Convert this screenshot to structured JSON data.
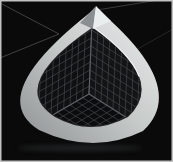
{
  "scene": {
    "title": "csg-sphere-cube-corner-render",
    "canvas": {
      "width": 173,
      "height": 162,
      "background": "#0a0a0b",
      "frame_color": "#c2c2c2",
      "frame_width": 1.5
    },
    "background_lines": {
      "color": "#4e4e4e",
      "width": 0.9,
      "segments": [
        {
          "x1": 0,
          "y1": 3,
          "x2": 59,
          "y2": 34,
          "opacity": 0.9
        },
        {
          "x1": 0,
          "y1": 58,
          "x2": 59,
          "y2": 34,
          "opacity": 0.9
        },
        {
          "x1": 97,
          "y1": 10,
          "x2": 158,
          "y2": 0,
          "opacity": 0.8
        },
        {
          "x1": 127,
          "y1": 55,
          "x2": 173,
          "y2": 29,
          "opacity": 0.45
        }
      ]
    },
    "shadow": {
      "cx": 80,
      "cy": 148,
      "rx": 62,
      "ry": 3.2,
      "color": "#303434",
      "opacity": 0.5
    },
    "band": {
      "outer_path": "M 96 8 Q 190.5 86.5 143 131 Q 93 155.5 39 130 Q -17.5 95 96 8 Z",
      "inner_path": "M 93 27 Q 167.5 80 128 117 Q 90.5 137 55 117 Q 6 86 93 27 Z",
      "gradient_stops": [
        "#edefef",
        "#c6cac9",
        "#8e9294"
      ],
      "gradient_offsets": [
        0,
        0.5,
        1
      ],
      "inner_shadow_color": "#232527",
      "inner_shadow_width": 2.2,
      "inner_highlight_path": "M 93 27 Q 130.25 53.5 139 76",
      "inner_highlight_color": "#f0f2f2",
      "inner_highlight_width": 1.4
    },
    "top_facets": {
      "left": {
        "points": "96,6 80,23 93,29",
        "color": "#8a8e90"
      },
      "right": {
        "points": "96,6 111,21 93,29",
        "color": "#e9eded"
      }
    },
    "mesh": {
      "corner": [
        89,
        94
      ],
      "up": [
        92,
        22
      ],
      "left": [
        32,
        127
      ],
      "right": [
        143,
        128
      ],
      "divisions": 9,
      "extend": 1.15,
      "interior_fill": "#050505",
      "left_wall_fill": "#0f1011",
      "right_wall_fill": "#131415",
      "floor_fill": "#0b0c0d",
      "grid_color": "#45484b",
      "grid_width": 0.7,
      "edge_color": "#5c6062",
      "edge_width": 1.1
    }
  }
}
